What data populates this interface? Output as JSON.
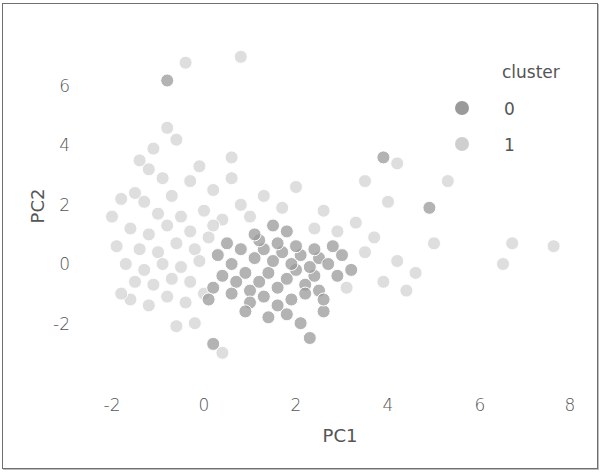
{
  "chart_data": {
    "type": "scatter",
    "title": "",
    "xlabel": "PC1",
    "ylabel": "PC2",
    "xlim": [
      -2.3,
      8.3
    ],
    "ylim": [
      -3.6,
      7.2
    ],
    "x_ticks": [
      -2,
      0,
      2,
      4,
      6,
      8
    ],
    "y_ticks": [
      -2,
      0,
      2,
      4,
      6
    ],
    "x_tick_labels": [
      "-2",
      "0",
      "2",
      "4",
      "6",
      "8"
    ],
    "y_tick_labels": [
      "-2",
      "0",
      "2",
      "4",
      "6"
    ],
    "grid": false,
    "legend": {
      "title": "cluster",
      "position": "upper right",
      "entries": [
        "0",
        "1"
      ]
    },
    "series": [
      {
        "name": "0",
        "color": "#9a9a9a",
        "points": [
          [
            -0.8,
            6.2
          ],
          [
            1.0,
            -0.9
          ],
          [
            1.2,
            -0.6
          ],
          [
            1.4,
            -0.3
          ],
          [
            1.6,
            -0.8
          ],
          [
            1.8,
            -0.5
          ],
          [
            2.0,
            -0.2
          ],
          [
            2.2,
            -0.7
          ],
          [
            2.4,
            -0.4
          ],
          [
            1.1,
            0.2
          ],
          [
            1.3,
            0.5
          ],
          [
            1.5,
            0.1
          ],
          [
            1.7,
            0.4
          ],
          [
            1.9,
            0.0
          ],
          [
            2.1,
            0.3
          ],
          [
            2.3,
            -0.1
          ],
          [
            2.5,
            0.2
          ],
          [
            0.9,
            -0.3
          ],
          [
            0.7,
            -0.6
          ],
          [
            1.0,
            -1.3
          ],
          [
            1.3,
            -1.1
          ],
          [
            1.6,
            -1.4
          ],
          [
            1.9,
            -1.2
          ],
          [
            2.2,
            -1.0
          ],
          [
            2.5,
            -0.9
          ],
          [
            0.8,
            0.5
          ],
          [
            1.2,
            0.8
          ],
          [
            1.6,
            0.7
          ],
          [
            2.0,
            0.6
          ],
          [
            2.4,
            0.5
          ],
          [
            2.7,
            0.0
          ],
          [
            2.9,
            -0.4
          ],
          [
            0.6,
            -1.0
          ],
          [
            0.9,
            -1.6
          ],
          [
            1.4,
            -1.8
          ],
          [
            1.8,
            -1.7
          ],
          [
            2.1,
            -2.0
          ],
          [
            0.6,
            0.0
          ],
          [
            0.4,
            -0.4
          ],
          [
            3.9,
            3.6
          ],
          [
            4.9,
            1.9
          ],
          [
            2.3,
            -2.5
          ],
          [
            0.2,
            -2.7
          ],
          [
            2.6,
            -1.6
          ],
          [
            3.0,
            0.3
          ],
          [
            1.1,
            1.0
          ],
          [
            0.3,
            0.3
          ],
          [
            0.5,
            0.7
          ],
          [
            2.8,
            0.6
          ],
          [
            3.2,
            -0.2
          ],
          [
            1.5,
            1.3
          ],
          [
            1.8,
            1.1
          ],
          [
            2.6,
            -1.2
          ],
          [
            0.2,
            -0.8
          ],
          [
            0.1,
            -1.2
          ]
        ]
      },
      {
        "name": "1",
        "color": "#c8c8c8",
        "points": [
          [
            -0.4,
            6.8
          ],
          [
            0.8,
            7.0
          ],
          [
            -0.8,
            4.6
          ],
          [
            -0.6,
            4.2
          ],
          [
            -1.1,
            3.9
          ],
          [
            0.6,
            3.6
          ],
          [
            -1.2,
            3.2
          ],
          [
            -0.9,
            2.9
          ],
          [
            -0.3,
            2.8
          ],
          [
            -1.5,
            2.4
          ],
          [
            -1.8,
            2.2
          ],
          [
            -1.3,
            2.1
          ],
          [
            -0.7,
            2.3
          ],
          [
            0.2,
            2.5
          ],
          [
            -1.0,
            1.7
          ],
          [
            -0.5,
            1.6
          ],
          [
            0.0,
            1.8
          ],
          [
            0.4,
            1.5
          ],
          [
            -1.6,
            1.2
          ],
          [
            -1.2,
            1.0
          ],
          [
            -0.8,
            1.3
          ],
          [
            -0.3,
            1.1
          ],
          [
            0.1,
            0.9
          ],
          [
            -1.9,
            0.6
          ],
          [
            -1.4,
            0.5
          ],
          [
            -1.0,
            0.4
          ],
          [
            -0.6,
            0.7
          ],
          [
            -0.2,
            0.5
          ],
          [
            -1.7,
            0.0
          ],
          [
            -1.3,
            -0.2
          ],
          [
            -0.9,
            0.0
          ],
          [
            -0.5,
            -0.1
          ],
          [
            -0.1,
            0.1
          ],
          [
            -1.5,
            -0.6
          ],
          [
            -1.1,
            -0.7
          ],
          [
            -0.7,
            -0.5
          ],
          [
            -0.3,
            -0.6
          ],
          [
            -1.6,
            -1.2
          ],
          [
            -1.2,
            -1.4
          ],
          [
            -0.8,
            -1.1
          ],
          [
            -0.4,
            -1.3
          ],
          [
            0.0,
            -1.0
          ],
          [
            -1.8,
            -1.0
          ],
          [
            -0.2,
            -2.0
          ],
          [
            0.6,
            2.9
          ],
          [
            0.8,
            2.0
          ],
          [
            1.0,
            1.6
          ],
          [
            1.3,
            2.3
          ],
          [
            2.0,
            2.6
          ],
          [
            2.6,
            1.8
          ],
          [
            3.3,
            1.4
          ],
          [
            3.5,
            2.8
          ],
          [
            4.2,
            3.4
          ],
          [
            4.0,
            2.1
          ],
          [
            3.7,
            0.9
          ],
          [
            3.5,
            0.4
          ],
          [
            3.1,
            -0.8
          ],
          [
            4.2,
            0.1
          ],
          [
            4.6,
            -0.3
          ],
          [
            5.0,
            0.7
          ],
          [
            4.4,
            -0.9
          ],
          [
            6.7,
            0.7
          ],
          [
            7.6,
            0.6
          ],
          [
            6.5,
            0.0
          ],
          [
            5.3,
            2.8
          ],
          [
            -1.4,
            3.5
          ],
          [
            -0.1,
            3.3
          ],
          [
            0.4,
            -3.0
          ],
          [
            2.9,
            1.1
          ],
          [
            3.9,
            -0.6
          ],
          [
            -2.0,
            1.6
          ],
          [
            -0.6,
            -2.1
          ],
          [
            1.7,
            1.9
          ],
          [
            2.4,
            1.2
          ],
          [
            0.2,
            1.3
          ]
        ]
      }
    ]
  },
  "axes": {
    "xlabel": "PC1",
    "ylabel": "PC2",
    "x_ticks": [
      "-2",
      "0",
      "2",
      "4",
      "6",
      "8"
    ],
    "y_ticks": [
      "6",
      "4",
      "2",
      "0",
      "-2"
    ]
  },
  "legend": {
    "title": "cluster",
    "items": [
      {
        "label": "0",
        "color": "#9a9a9a"
      },
      {
        "label": "1",
        "color": "#c8c8c8"
      }
    ]
  }
}
